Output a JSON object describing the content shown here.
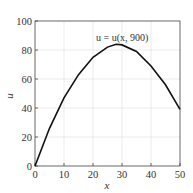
{
  "chart_data": {
    "type": "line",
    "title": "",
    "xlabel": "x",
    "ylabel": "u",
    "xlim": [
      0,
      50
    ],
    "ylim": [
      0,
      100
    ],
    "xticks": [
      0,
      10,
      20,
      30,
      40,
      50
    ],
    "yticks": [
      0,
      20,
      40,
      60,
      80,
      100
    ],
    "grid": true,
    "annotation": "u = u(x, 900)",
    "series": [
      {
        "name": "u = u(x, 900)",
        "x": [
          0,
          5,
          10,
          15,
          20,
          25,
          28,
          30,
          35,
          40,
          45,
          50
        ],
        "y": [
          0,
          26,
          47,
          63,
          75,
          82,
          84,
          83.5,
          79,
          69,
          56,
          39
        ]
      }
    ]
  }
}
